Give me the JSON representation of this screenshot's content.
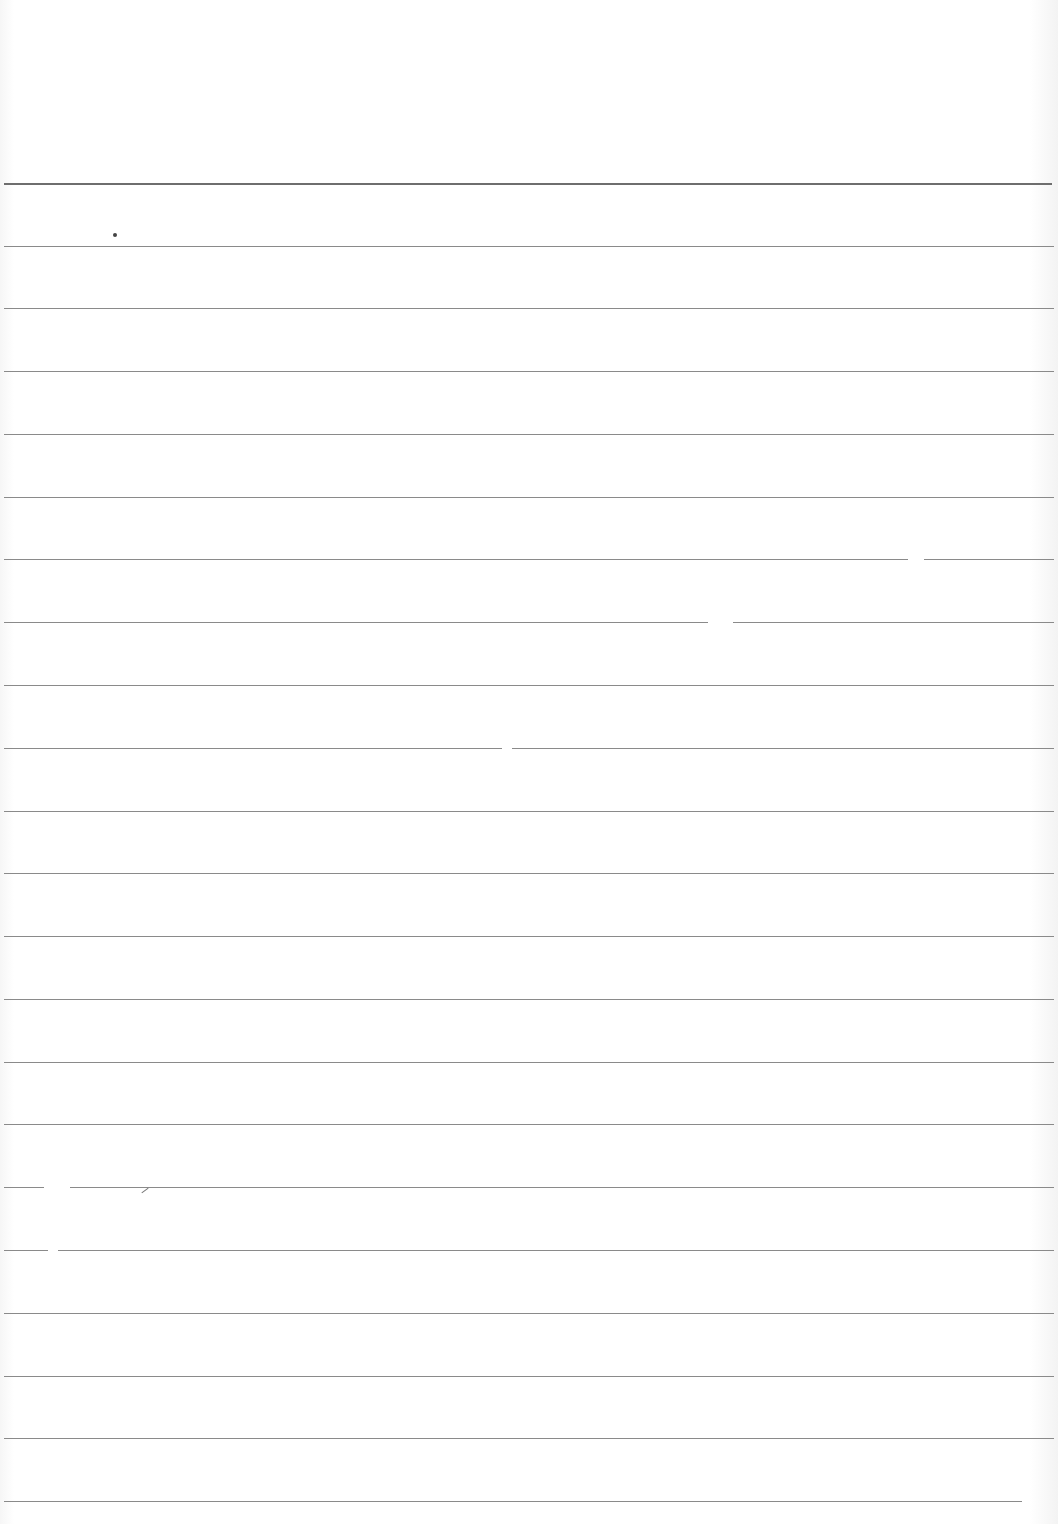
{
  "page": {
    "type": "ruled-paper",
    "background": "#ffffff",
    "rule_color": "#8a8a8a",
    "top_rule_color": "#6e6e6e"
  },
  "rules": [
    {
      "y": 183,
      "x1": 4,
      "x2": 1052,
      "top": true
    },
    {
      "y": 246,
      "x1": 4,
      "x2": 1054
    },
    {
      "y": 308,
      "x1": 4,
      "x2": 1054
    },
    {
      "y": 371,
      "x1": 4,
      "x2": 1054
    },
    {
      "y": 434,
      "x1": 4,
      "x2": 1054
    },
    {
      "y": 497,
      "x1": 4,
      "x2": 1054
    },
    {
      "y": 559,
      "x1": 4,
      "x2": 1054,
      "gaps": [
        [
          908,
          924
        ]
      ]
    },
    {
      "y": 622,
      "x1": 4,
      "x2": 1054,
      "gaps": [
        [
          708,
          733
        ]
      ]
    },
    {
      "y": 685,
      "x1": 4,
      "x2": 1054
    },
    {
      "y": 748,
      "x1": 4,
      "x2": 1054,
      "gaps": [
        [
          502,
          512
        ]
      ]
    },
    {
      "y": 811,
      "x1": 4,
      "x2": 1054
    },
    {
      "y": 873,
      "x1": 4,
      "x2": 1054
    },
    {
      "y": 936,
      "x1": 4,
      "x2": 1054
    },
    {
      "y": 999,
      "x1": 4,
      "x2": 1054
    },
    {
      "y": 1062,
      "x1": 4,
      "x2": 1054
    },
    {
      "y": 1124,
      "x1": 4,
      "x2": 1054
    },
    {
      "y": 1187,
      "x1": 4,
      "x2": 1054,
      "gaps": [
        [
          44,
          70
        ]
      ]
    },
    {
      "y": 1250,
      "x1": 4,
      "x2": 1054,
      "gaps": [
        [
          48,
          58
        ]
      ]
    },
    {
      "y": 1313,
      "x1": 4,
      "x2": 1054
    },
    {
      "y": 1376,
      "x1": 4,
      "x2": 1054
    },
    {
      "y": 1438,
      "x1": 4,
      "x2": 1054
    },
    {
      "y": 1501,
      "x1": 4,
      "x2": 1022
    }
  ],
  "marks": [
    {
      "kind": "speck",
      "x": 113,
      "y": 233,
      "size": 4
    },
    {
      "kind": "stroke",
      "x": 141,
      "y": 1190
    }
  ]
}
